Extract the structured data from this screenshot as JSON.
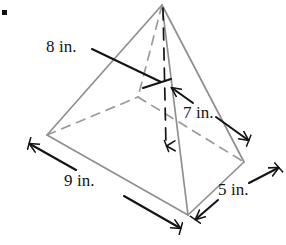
{
  "figure": {
    "kind": "rectangular-pyramid-diagram",
    "bullet_marker": "▪",
    "colors": {
      "solid_edge": "#8f8f8f",
      "hidden_edge": "#9a9a9a",
      "annotation": "#141414",
      "background": "#ffffff"
    },
    "geometry": {
      "apex": [
        162,
        5
      ],
      "base_left": [
        47,
        135
      ],
      "base_front": [
        188,
        215
      ],
      "base_right": [
        244,
        162
      ],
      "base_back": [
        138,
        97
      ],
      "base_center": [
        165,
        152
      ]
    },
    "labels": {
      "slant_height": "8 in.",
      "lateral_slant": "7 in.",
      "base_length": "9 in.",
      "base_width": "5 in."
    },
    "label_roles": {
      "slant_height_role": "slant height to left face",
      "lateral_slant_role": "slant height to right face",
      "base_length_role": "base length along front-left edge",
      "base_width_role": "base width along front-right edge"
    }
  }
}
